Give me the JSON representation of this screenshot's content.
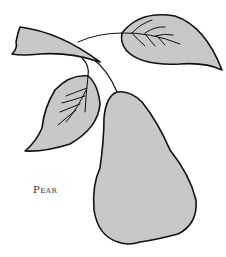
{
  "illustration": {
    "subject": "pear",
    "caption": "Pear",
    "fill_color": "#c8c8c8",
    "outline_color": "#111111",
    "background": "#ffffff"
  }
}
